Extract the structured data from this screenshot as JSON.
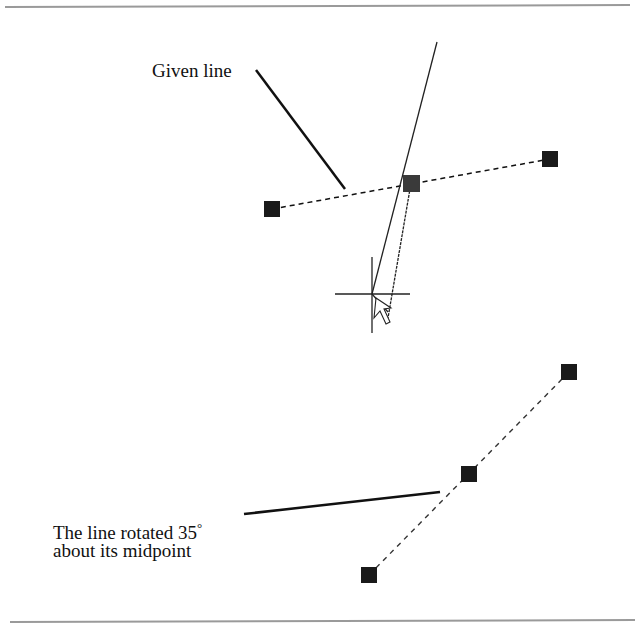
{
  "labels": {
    "given_line": "Given line",
    "rotated_line_1": "The line rotated 35",
    "degree": "°",
    "rotated_line_2": "about its midpoint"
  },
  "colors": {
    "rule": "#9a9a9a",
    "stroke": "#111111",
    "grip": "#1a1a1a",
    "active_grip": "#3a3a3a"
  },
  "geometry": {
    "given_line": {
      "start": [
        272,
        209
      ],
      "mid": [
        411,
        183
      ],
      "end": [
        550,
        159
      ]
    },
    "rotated_line": {
      "start": [
        369,
        575
      ],
      "mid": [
        469,
        474
      ],
      "end": [
        569,
        372
      ]
    },
    "rotation_angle_deg": 35,
    "cursor": [
      372,
      294
    ]
  }
}
